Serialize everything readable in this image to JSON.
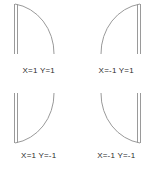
{
  "figure": {
    "line_color": "#9a9a9a",
    "text_color": "#2b2b2b",
    "background": "#ffffff"
  },
  "cells": [
    {
      "id": "top-left",
      "caption": "X=1 Y=1",
      "x_sign": "1",
      "y_sign": "1",
      "bar_side": "left",
      "arc_bulge": "right"
    },
    {
      "id": "top-right",
      "caption": "X=-1 Y=1",
      "x_sign": "-1",
      "y_sign": "1",
      "bar_side": "right",
      "arc_bulge": "left"
    },
    {
      "id": "bottom-left",
      "caption": "X=1 Y=-1",
      "x_sign": "1",
      "y_sign": "-1",
      "bar_side": "left",
      "arc_bulge": "right"
    },
    {
      "id": "bottom-right",
      "caption": "X=-1 Y=-1",
      "x_sign": "-1",
      "y_sign": "-1",
      "bar_side": "right",
      "arc_bulge": "left"
    }
  ]
}
